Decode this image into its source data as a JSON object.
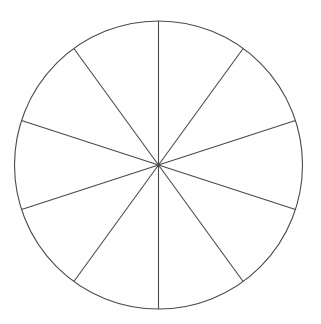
{
  "chart_data": {
    "type": "pie",
    "title": "",
    "categories": [
      "",
      "",
      "",
      "",
      "",
      "",
      "",
      "",
      "",
      ""
    ],
    "values": [
      10,
      10,
      10,
      10,
      10,
      10,
      10,
      10,
      10,
      10
    ],
    "slice_count": 10,
    "start_angle_deg": 90,
    "labels_visible": false,
    "legend": null,
    "fill": "none"
  },
  "style": {
    "background": "#ffffff",
    "stroke": "#4a4a4a",
    "stroke_width": 1.1
  },
  "geometry": {
    "cx": 158.5,
    "cy": 165,
    "r": 144
  }
}
